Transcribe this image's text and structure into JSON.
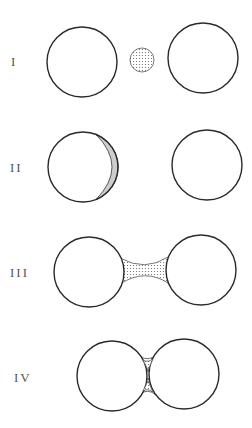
{
  "figure": {
    "stages": [
      {
        "label": "I",
        "description": "Two separate circles with a small dotted particle between them"
      },
      {
        "label": "II",
        "description": "Particle attached as a hatched crescent on the left circle; right circle separate"
      },
      {
        "label": "III",
        "description": "Two circles joined by a dotted concave bridge"
      },
      {
        "label": "IV",
        "description": "Two circles in contact with dotted cusps above and below the contact point"
      }
    ],
    "colors": {
      "line": "#2a2a2a",
      "label": "#555555",
      "background": "#ffffff",
      "texture": "#666666"
    }
  }
}
